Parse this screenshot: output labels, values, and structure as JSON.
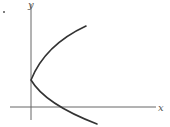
{
  "figure": {
    "axis_labels": {
      "x": "x",
      "y": "y"
    },
    "colors": {
      "axis": "#666666",
      "curve": "#333333",
      "background": "#ffffff"
    },
    "curve": {
      "type": "sideways-parabola",
      "vertex": [
        31,
        80
      ],
      "upper_end": [
        86,
        26
      ],
      "lower_end": [
        97,
        124
      ],
      "x_intercept": [
        57,
        107
      ]
    }
  }
}
